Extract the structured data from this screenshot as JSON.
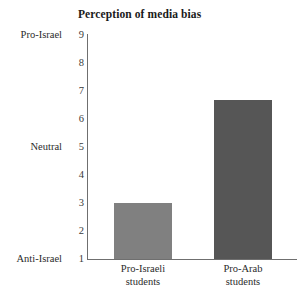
{
  "chart_data": {
    "type": "bar",
    "title": "Perception of media bias",
    "xlabel": "",
    "ylabel": "",
    "categories": [
      "Pro-Israeli students",
      "Pro-Arab students"
    ],
    "category_lines": [
      {
        "line1": "Pro-Israeli",
        "line2": "students"
      },
      {
        "line1": "Pro-Arab",
        "line2": "students"
      }
    ],
    "values": [
      3.0,
      6.65
    ],
    "ylim": [
      1,
      9
    ],
    "yticks": [
      9,
      8,
      7,
      6,
      5,
      4,
      3,
      2,
      1
    ],
    "ytick_labels": [
      "9",
      "8",
      "7",
      "6",
      "5",
      "4",
      "3",
      "2",
      "1"
    ],
    "y_anchor_labels": [
      {
        "value": 9,
        "label": "Pro-Israel"
      },
      {
        "value": 5,
        "label": "Neutral"
      },
      {
        "value": 1,
        "label": "Anti-Israel"
      }
    ],
    "grid": false,
    "legend": false,
    "legend_position": "none",
    "bar_colors": [
      "#808080",
      "#565656"
    ],
    "axis_color": "#6f6f6f",
    "background": "#ffffff"
  }
}
